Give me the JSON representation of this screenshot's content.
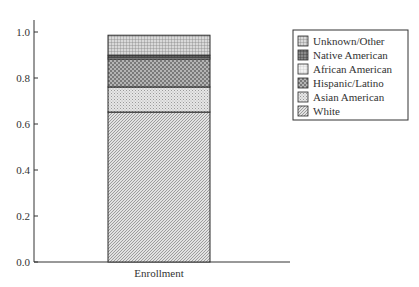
{
  "chart_data": {
    "type": "bar",
    "stacked": true,
    "title": "",
    "xlabel": "",
    "ylabel": "",
    "categories": [
      "Enrollment"
    ],
    "series": [
      {
        "name": "White",
        "values": [
          0.652
        ],
        "pattern": "diag-fine",
        "color": "#c9c9c9"
      },
      {
        "name": "Asian American",
        "values": [
          0.109
        ],
        "pattern": "dots-light",
        "color": "#d6d6d6"
      },
      {
        "name": "Hispanic/Latino",
        "values": [
          0.122
        ],
        "pattern": "checker-dark",
        "color": "#9a9a9a"
      },
      {
        "name": "African American",
        "values": [
          0.008
        ],
        "pattern": "grid-light",
        "color": "#e8e8e8"
      },
      {
        "name": "Native American",
        "values": [
          0.008
        ],
        "pattern": "grid-dark",
        "color": "#707070"
      },
      {
        "name": "Unknown/Other",
        "values": [
          0.087
        ],
        "pattern": "grid-medium",
        "color": "#a8a8a8"
      }
    ],
    "ylim": [
      0.0,
      1.05
    ],
    "yticks": [
      "0.0",
      "0.2",
      "0.4",
      "0.6",
      "0.8",
      "1.0"
    ],
    "ytick_values": [
      0.0,
      0.2,
      0.4,
      0.6,
      0.8,
      1.0
    ],
    "grid": false,
    "legend_position": "upper right, outside plot",
    "legend_order": [
      "Unknown/Other",
      "Native American",
      "African American",
      "Hispanic/Latino",
      "Asian American",
      "White"
    ]
  }
}
